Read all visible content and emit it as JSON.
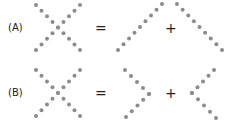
{
  "rows": [
    {
      "label": "(A)",
      "equals": "=",
      "plus": "+"
    },
    {
      "label": "(B)",
      "equals": "=",
      "plus": "+"
    }
  ],
  "dot_color": "#8c8c8c",
  "figures": {
    "A": {
      "x_shape": "X",
      "part1": "/ diagonal",
      "part2": "\\ diagonal"
    },
    "B": {
      "x_shape": "X",
      "part1": "> chevron",
      "part2": "< chevron"
    }
  }
}
